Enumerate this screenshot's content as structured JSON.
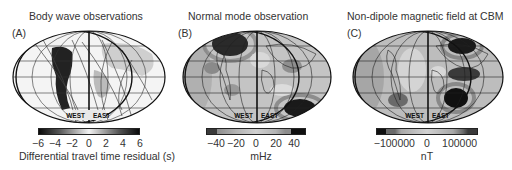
{
  "figure": {
    "panels": [
      {
        "letter": "(A)",
        "title": "Body wave observations",
        "hemisphere_labels": [
          "WEST",
          "EAST"
        ],
        "colorbar": {
          "ticks": [
            "−6",
            "−4",
            "−2",
            "0",
            "2",
            "4",
            "6"
          ],
          "label": "Differential travel time residual (s)",
          "range": [
            -6,
            6
          ],
          "colors": [
            "#0a0a0a",
            "#555555",
            "#bdbdbd",
            "#f2f2f2",
            "#bdbdbd",
            "#555555",
            "#0a0a0a"
          ]
        }
      },
      {
        "letter": "(B)",
        "title": "Normal mode observation",
        "hemisphere_labels": [
          "WEST",
          "EAST"
        ],
        "colorbar": {
          "ticks": [
            "−40",
            "−20",
            "0",
            "20",
            "40"
          ],
          "label": "mHz",
          "range": [
            -50,
            50
          ],
          "colors": [
            "#3a3a3a",
            "#8c8c8c",
            "#b3b3b3",
            "#d0d0d0",
            "#b3b3b3",
            "#8c8c8c",
            "#101010"
          ]
        }
      },
      {
        "letter": "(C)",
        "title": "Non-dipole magnetic field at CBM",
        "hemisphere_labels": [
          "WEST",
          "EAST"
        ],
        "colorbar": {
          "ticks": [
            "−100000",
            "0",
            "100000"
          ],
          "label": "nT",
          "range": [
            -150000,
            150000
          ],
          "colors": [
            "#101010",
            "#6a6a6a",
            "#a8a8a8",
            "#d2d2d2",
            "#a8a8a8",
            "#6a6a6a",
            "#3a3a3a"
          ]
        }
      }
    ]
  }
}
